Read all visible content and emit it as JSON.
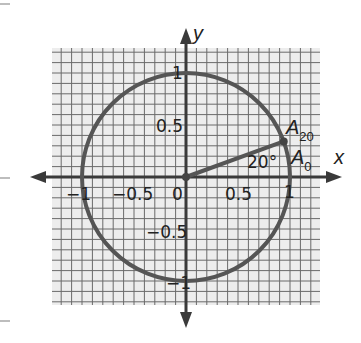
{
  "diagram": {
    "title": "",
    "axes": {
      "x_label": "x",
      "y_label": "y",
      "x_ticks": [
        {
          "value": -1,
          "label": "−1"
        },
        {
          "value": -0.5,
          "label": "−0.5"
        },
        {
          "value": 0,
          "label": "0"
        },
        {
          "value": 0.5,
          "label": "0.5"
        },
        {
          "value": 1,
          "label": "1"
        }
      ],
      "y_ticks": [
        {
          "value": 1,
          "label": "1"
        },
        {
          "value": 0.5,
          "label": "0.5"
        },
        {
          "value": -0.5,
          "label": "−0.5"
        },
        {
          "value": -1,
          "label": "−1"
        }
      ]
    },
    "circle": {
      "center": [
        0,
        0
      ],
      "radius": 1,
      "label": "unit circle"
    },
    "points": [
      {
        "name": "A20",
        "main": "A",
        "sub": "20",
        "angle_deg": 20
      },
      {
        "name": "A0",
        "main": "A",
        "sub": "0",
        "angle_deg": 0
      }
    ],
    "angle_label": "20°",
    "grid": {
      "minor_step": 0.1,
      "x_range": [
        -1.3,
        1.3
      ],
      "y_range": [
        -1.25,
        1.25
      ]
    },
    "colors": {
      "grid_bg": "#ededed",
      "grid_line": "#6a6a6a",
      "axis": "#3a3a3a",
      "circle": "#555555",
      "text": "#222222"
    }
  }
}
